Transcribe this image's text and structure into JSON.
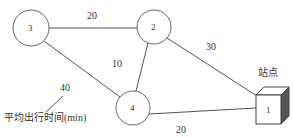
{
  "diagram": {
    "type": "network-graph",
    "nodes": [
      {
        "id": "3",
        "label": "3",
        "shape": "circle"
      },
      {
        "id": "2",
        "label": "2",
        "shape": "circle"
      },
      {
        "id": "4",
        "label": "4",
        "shape": "circle"
      },
      {
        "id": "1",
        "label": "1",
        "shape": "cube"
      }
    ],
    "edges": [
      {
        "from": "3",
        "to": "2",
        "weight": "20"
      },
      {
        "from": "2",
        "to": "1",
        "weight": "30"
      },
      {
        "from": "2",
        "to": "4",
        "weight": "10"
      },
      {
        "from": "3",
        "to": "4",
        "weight": "40"
      },
      {
        "from": "4",
        "to": "1",
        "weight": "20"
      }
    ],
    "station_label": "站点",
    "legend_label": "平均出行时间(min)",
    "colors": {
      "line": "#555555",
      "cube_side": "#555555",
      "text": "#333333"
    }
  }
}
